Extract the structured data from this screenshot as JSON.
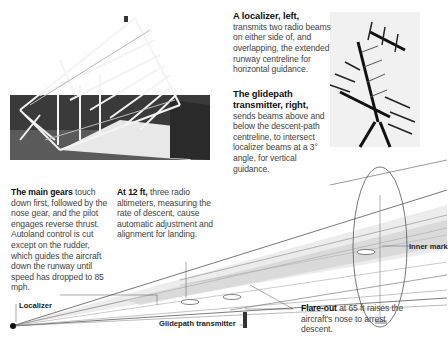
{
  "captions": {
    "localizer_photo": {
      "heading": "A localizer, left,",
      "body": "transmits two radio beams on either side of, and overlapping, the extended runway centreline for horizontal guidance."
    },
    "glidepath_photo": {
      "heading": "The glidepath transmitter, right,",
      "body": "sends beams above and below the descent-path centreline, to intersect localizer beams at a 3° angle, for vertical guidance."
    },
    "main_gears": {
      "lead": "The main gears",
      "body": " touch down first, followed by the nose gear, and the pilot engages reverse thrust. Autoland control is cut except on the rudder, which guides the aircraft down the runway until speed has dropped to 85 mph."
    },
    "at_12ft": {
      "lead": "At 12 ft,",
      "body": " three radio altimeters, measuring the rate of descent, cause automatic adjustment and alignment for landing."
    },
    "flare_out": {
      "lead": "Flare-out",
      "body": " at 65 ft raises the aircraft's nose to arrest descent."
    }
  },
  "labels": {
    "localizer": "Localizer",
    "glidepath_transmitter": "Glidepath transmitter",
    "inner_marker": "Inner mark"
  }
}
